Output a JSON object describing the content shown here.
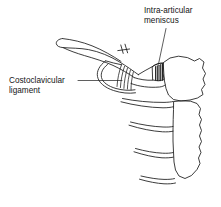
{
  "figure": {
    "background_color": "#ffffff",
    "ink_color": "#1a1a1a",
    "width": 221,
    "height": 207
  },
  "labels": {
    "meniscus": {
      "line1": "Intra-articular",
      "line2": "meniscus",
      "full_text": "Intra-articular meniscus"
    },
    "costoclavicular": {
      "line1": "Costoclavicular",
      "line2": "ligament",
      "full_text": "Costoclavicular ligament"
    }
  },
  "structures": {
    "clavicle": "clavicle",
    "manubrium": "manubrium-of-sternum",
    "sternum_body": "body-of-sternum",
    "meniscus": "intra-articular-meniscus",
    "costoclavicular_ligament": "costoclavicular-ligament",
    "ribs": "costal-cartilages",
    "rib_count": 4
  }
}
